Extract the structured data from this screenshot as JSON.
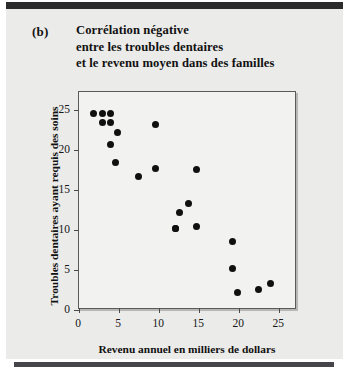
{
  "figure": {
    "panel_label": "(b)",
    "title_lines": [
      "Corrélation négative",
      "entre les troubles dentaires",
      "et le revenu moyen dans des familles"
    ]
  },
  "colors": {
    "background": "#ebebe9",
    "page": "#ffffff",
    "rule": "#2b2b2b",
    "plot_background": "#f2f2f0",
    "axis": "#5b5b5b",
    "marker": "#101010"
  },
  "chart_data": {
    "type": "scatter",
    "title": "Corrélation négative entre les troubles dentaires et le revenu moyen dans des familles",
    "xlabel": "Revenu annuel en milliers de dollars",
    "ylabel": "Troubles dentaires ayant requis des soins",
    "xlim": [
      0,
      27.2
    ],
    "ylim": [
      0,
      27.2
    ],
    "xticks": [
      0,
      5,
      10,
      15,
      20,
      25
    ],
    "yticks": [
      0,
      5,
      10,
      15,
      20,
      25
    ],
    "xticklabels": [
      "0",
      "5",
      "10",
      "15",
      "20",
      "25"
    ],
    "yticklabels": [
      "0",
      "5",
      "10",
      "15",
      "20",
      "25"
    ],
    "grid": false,
    "legend": false,
    "marker": "circle",
    "series": [
      {
        "name": "familles",
        "points": [
          {
            "x": 1.8,
            "y": 24.5
          },
          {
            "x": 2.9,
            "y": 24.5
          },
          {
            "x": 3.9,
            "y": 24.5
          },
          {
            "x": 2.9,
            "y": 23.4
          },
          {
            "x": 3.9,
            "y": 23.4
          },
          {
            "x": 4.8,
            "y": 22.2
          },
          {
            "x": 3.9,
            "y": 20.6
          },
          {
            "x": 4.5,
            "y": 18.4
          },
          {
            "x": 7.4,
            "y": 16.6
          },
          {
            "x": 9.6,
            "y": 23.2
          },
          {
            "x": 9.6,
            "y": 17.6
          },
          {
            "x": 14.6,
            "y": 17.5
          },
          {
            "x": 12.6,
            "y": 12.2
          },
          {
            "x": 13.7,
            "y": 13.3
          },
          {
            "x": 12.1,
            "y": 10.2
          },
          {
            "x": 14.7,
            "y": 10.4
          },
          {
            "x": 19.1,
            "y": 8.6
          },
          {
            "x": 19.1,
            "y": 5.2
          },
          {
            "x": 19.8,
            "y": 2.2
          },
          {
            "x": 22.4,
            "y": 2.6
          },
          {
            "x": 23.9,
            "y": 3.3
          },
          {
            "x": 12.1,
            "y": 10.2
          }
        ]
      }
    ]
  }
}
